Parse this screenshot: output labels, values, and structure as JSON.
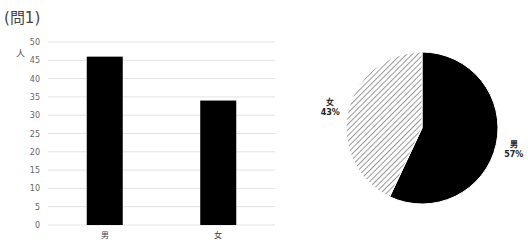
{
  "title": "(問1)",
  "chart_data": [
    {
      "type": "bar",
      "title": "",
      "categories": [
        "男",
        "女"
      ],
      "values": [
        46,
        34
      ],
      "xlabel": "",
      "ylabel": "人",
      "ylim": [
        0,
        50
      ],
      "yticks": [
        0,
        5,
        10,
        15,
        20,
        25,
        30,
        35,
        40,
        45,
        50
      ],
      "grid": true,
      "bar_color": "#000000"
    },
    {
      "type": "pie",
      "title": "",
      "labels": [
        "男",
        "女"
      ],
      "values": [
        57,
        43
      ],
      "data_labels": [
        "男\n57%",
        "女\n43%"
      ],
      "fills": [
        "solid-black",
        "diagonal-hatch"
      ],
      "colors": [
        "#000000",
        "#ffffff"
      ]
    }
  ]
}
